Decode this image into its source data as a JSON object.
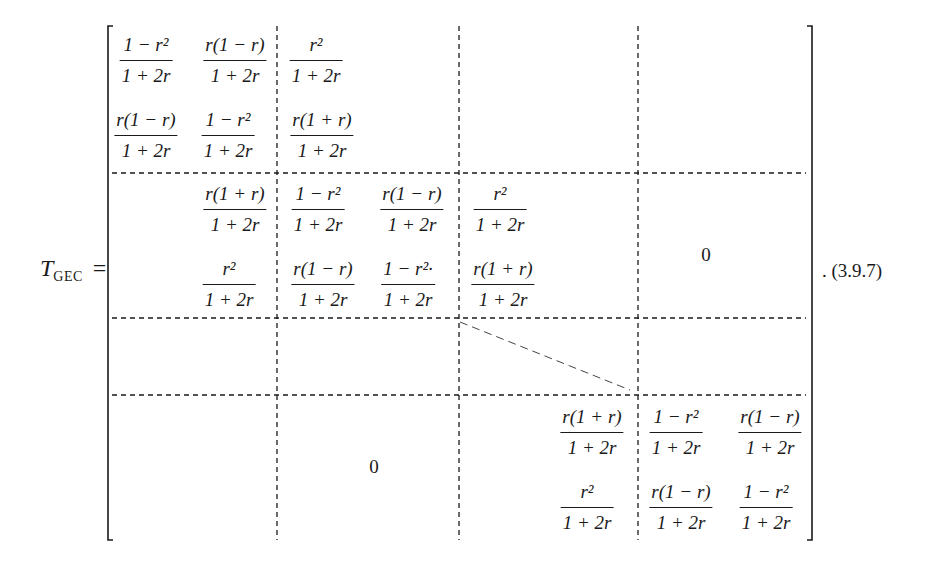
{
  "equation": {
    "lhs_symbol": "T",
    "lhs_subscript": "GEC",
    "equals": "=",
    "number": ". (3.9.7)"
  },
  "fractions": {
    "a": {
      "num": "1 − r²",
      "den": "1 + 2r"
    },
    "b": {
      "num": "r(1 − r)",
      "den": "1 + 2r"
    },
    "c": {
      "num": "r²",
      "den": "1 + 2r"
    },
    "d": {
      "num": "r(1 + r)",
      "den": "1 + 2r"
    },
    "e": {
      "num": "1 − r²·",
      "den": "1 + 2r"
    }
  },
  "matrix": {
    "block_1": {
      "rows": [
        [
          "1 − r² / 1 + 2r",
          "r(1 − r) / 1 + 2r",
          "r² / 1 + 2r"
        ],
        [
          "r(1 − r) / 1 + 2r",
          "1 − r² / 1 + 2r",
          "r(1 + r) / 1 + 2r"
        ]
      ]
    },
    "block_2": {
      "rows": [
        [
          "r(1 + r) / 1 + 2r",
          "1 − r² / 1 + 2r",
          "r(1 − r) / 1 + 2r",
          "r² / 1 + 2r"
        ],
        [
          "r² / 1 + 2r",
          "r(1 − r) / 1 + 2r",
          "1 − r²· / 1 + 2r",
          "r(1 + r) / 1 + 2r"
        ]
      ]
    },
    "block_last": {
      "rows": [
        [
          "r(1 + r) / 1 + 2r",
          "1 − r² / 1 + 2r",
          "r(1 − r) / 1 + 2r"
        ],
        [
          "r² / 1 + 2r",
          "r(1 − r) / 1 + 2r",
          "1 − r² / 1 + 2r"
        ]
      ]
    },
    "upper_right_zero": "0",
    "lower_left_zero": "0"
  }
}
